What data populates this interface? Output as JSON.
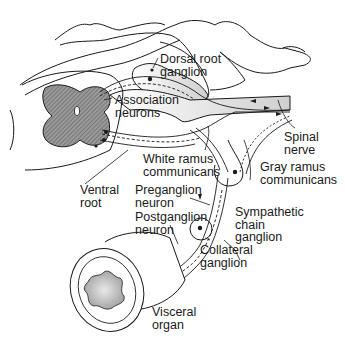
{
  "diagram": {
    "colors": {
      "ink": "#1a1a1a",
      "hatch": "#6e6e6e",
      "shade": "#c9c9c9",
      "background": "#ffffff"
    },
    "labels": {
      "dorsal_root_ganglion": "Dorsal root\nganglion",
      "association_neurons": "Association\nneurons",
      "spinal_nerve": "Spinal\nnerve",
      "white_ramus": "White ramus\ncommunicans",
      "gray_ramus": "Gray ramus\ncommunicans",
      "ventral_root": "Ventral\nroot",
      "preganglion_neuron": "Preganglion\nneuron",
      "postganglion_neuron": "Postganglion\nneuron",
      "sympathetic_chain_ganglion": "Sympathetic\nchain\nganglion",
      "collateral_ganglion": "Collateral\nganglion",
      "visceral_organ": "Visceral\norgan"
    }
  }
}
